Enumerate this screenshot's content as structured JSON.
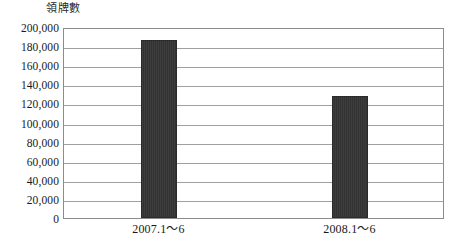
{
  "chart_data": {
    "type": "bar",
    "title": "領牌數",
    "xlabel": "",
    "ylabel": "",
    "categories": [
      "2007.1〜6",
      "2008.1〜6"
    ],
    "values": [
      186000,
      128000
    ],
    "ylim": [
      0,
      200000
    ],
    "ytick_step": 20000,
    "ytick_labels": [
      "200,000",
      "180,000",
      "160,000",
      "140,000",
      "120,000",
      "100,000",
      "80,000",
      "60,000",
      "40,000",
      "20,000",
      "0"
    ],
    "ytick_values": [
      200000,
      180000,
      160000,
      140000,
      120000,
      100000,
      80000,
      60000,
      40000,
      20000,
      0
    ],
    "grid": true,
    "legend": false,
    "legend_position": "none",
    "series": [
      {
        "name": "領牌數",
        "values": [
          186000,
          128000
        ],
        "color": "#333333"
      }
    ],
    "colors": {
      "bar": "#333333",
      "gridline": "#a0a0a0",
      "frame": "#8c8c8c",
      "background": "#ffffff",
      "text": "#1a1a1a"
    }
  }
}
